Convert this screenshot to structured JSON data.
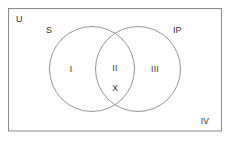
{
  "diagram": {
    "type": "venn",
    "title": "",
    "universe": {
      "label": "U",
      "region_label": "IV"
    },
    "sets": [
      {
        "id": "left",
        "label": "S",
        "region_label": "I"
      },
      {
        "id": "right",
        "label": "IP",
        "region_label": "III"
      }
    ],
    "intersection": {
      "region_label": "II",
      "mark": "X"
    },
    "colors": {
      "background": "#ffffff",
      "stroke": "#808080",
      "text": "#2b2b2b"
    }
  }
}
